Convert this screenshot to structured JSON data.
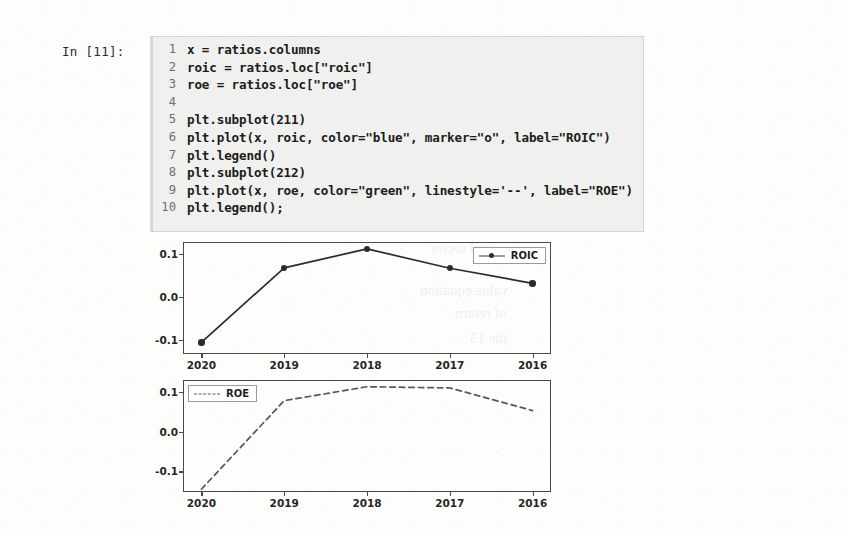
{
  "notebook": {
    "prompt": "In [11]:",
    "code_lines": [
      {
        "n": "1",
        "text": "x = ratios.columns"
      },
      {
        "n": "2",
        "text": "roic = ratios.loc[\"roic\"]"
      },
      {
        "n": "3",
        "text": "roe = ratios.loc[\"roe\"]"
      },
      {
        "n": "4",
        "text": ""
      },
      {
        "n": "5",
        "text": "plt.subplot(211)"
      },
      {
        "n": "6",
        "text": "plt.plot(x, roic, color=\"blue\", marker=\"o\", label=\"ROIC\")"
      },
      {
        "n": "7",
        "text": "plt.legend()"
      },
      {
        "n": "8",
        "text": "plt.subplot(212)"
      },
      {
        "n": "9",
        "text": "plt.plot(x, roe, color=\"green\", linestyle='--', label=\"ROE\")"
      },
      {
        "n": "10",
        "text": "plt.legend();"
      }
    ]
  },
  "showthrough": [
    {
      "text": "d on to construct",
      "x": 455,
      "y": 54,
      "size": 15
    },
    {
      "text": "a capital sector",
      "x": 430,
      "y": 240,
      "size": 15
    },
    {
      "text": "value equation",
      "x": 420,
      "y": 282,
      "size": 15
    },
    {
      "text": "of return",
      "x": 455,
      "y": 305,
      "size": 15
    },
    {
      "text": "the 13",
      "x": 470,
      "y": 330,
      "size": 15
    }
  ],
  "chart_data": [
    {
      "type": "line",
      "name": "roic-subplot",
      "subplot": "211",
      "categories": [
        "2020",
        "2019",
        "2018",
        "2017",
        "2016"
      ],
      "series": [
        {
          "name": "ROIC",
          "color": "#0000ff",
          "rendered_color": "#2b2b2b",
          "linestyle": "-",
          "marker": "o",
          "values": [
            -0.105,
            0.068,
            0.112,
            0.067,
            0.032
          ]
        }
      ],
      "title": "",
      "xlabel": "",
      "ylabel": "",
      "yticks": [
        0.1,
        0.0,
        -0.1
      ],
      "ytick_labels": [
        "0.1",
        "0.0",
        "-0.1"
      ],
      "ylim": [
        -0.132,
        0.128
      ],
      "grid": false,
      "legend_position": "upper right"
    },
    {
      "type": "line",
      "name": "roe-subplot",
      "subplot": "212",
      "categories": [
        "2020",
        "2019",
        "2018",
        "2017",
        "2016"
      ],
      "series": [
        {
          "name": "ROE",
          "color": "#008000",
          "rendered_color": "#585858",
          "linestyle": "--",
          "marker": "",
          "values": [
            -0.145,
            0.078,
            0.113,
            0.11,
            0.053
          ]
        }
      ],
      "title": "",
      "xlabel": "",
      "ylabel": "",
      "yticks": [
        0.1,
        0.0,
        -0.1
      ],
      "ytick_labels": [
        "0.1",
        "0.0",
        "-0.1"
      ],
      "ylim": [
        -0.152,
        0.13
      ],
      "grid": false,
      "legend_position": "upper left"
    }
  ]
}
